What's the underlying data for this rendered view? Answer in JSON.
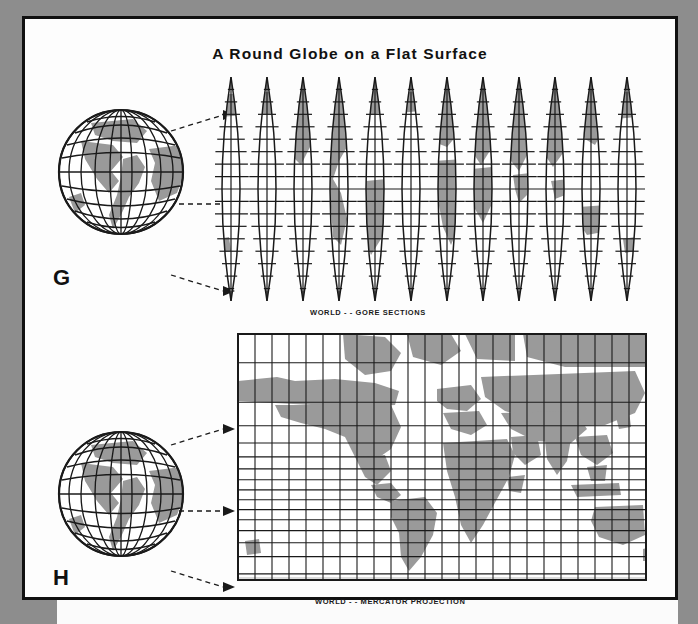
{
  "page": {
    "title": "A Round Globe on a Flat Surface",
    "background_color": "#8d8d8d",
    "paper_color": "#fdfdfd",
    "border_color": "#111111",
    "land_color": "#9a9a9a",
    "line_color": "#1a1a1a"
  },
  "figures": [
    {
      "letter": "G",
      "caption": "WORLD - - GORE SECTIONS",
      "globe_name": "globe-illustration-gore",
      "map_type": "gore-sections",
      "gore_count": 12,
      "arrow_count": 3
    },
    {
      "letter": "H",
      "caption": "WORLD - - MERCATOR PROJECTION",
      "globe_name": "globe-illustration-mercator",
      "map_type": "mercator-projection",
      "meridian_columns": 24,
      "arrow_count": 3
    }
  ],
  "chart_data": {
    "type": "map",
    "title": "A Round Globe on a Flat Surface",
    "panels": [
      {
        "id": "gore-sections",
        "label": "WORLD - - GORE SECTIONS",
        "projection": "interrupted gores (globe gore sections)",
        "gores": 12,
        "gore_width_degrees": 30,
        "lat_tick_labels": [
          "80°",
          "70°",
          "60°",
          "50°",
          "40°",
          "30°",
          "20°",
          "10°",
          "0°",
          "10°",
          "20°",
          "30°",
          "40°",
          "50°",
          "60°",
          "70°",
          "80°"
        ],
        "lat_tick_values": [
          80,
          70,
          60,
          50,
          40,
          30,
          20,
          10,
          0,
          -10,
          -20,
          -30,
          -40,
          -50,
          -60,
          -70,
          -80
        ],
        "lat_spacing": "equally spaced (equidistant in latitude)",
        "grid": true
      },
      {
        "id": "mercator-projection",
        "label": "WORLD - - MERCATOR PROJECTION",
        "projection": "Mercator",
        "lat_tick_labels": [
          "80°",
          "70°",
          "60°",
          "50°",
          "40°",
          "30°",
          "20°",
          "10°",
          "0°",
          "10°",
          "20°",
          "30°",
          "40°",
          "50°",
          "60°"
        ],
        "lat_tick_values": [
          80,
          70,
          60,
          50,
          40,
          30,
          20,
          10,
          0,
          -10,
          -20,
          -30,
          -40,
          -50,
          -60
        ],
        "lat_spacing": "Mercator (expanding toward the poles)",
        "meridian_spacing_degrees": 15,
        "meridian_columns": 24,
        "grid": true
      }
    ]
  }
}
